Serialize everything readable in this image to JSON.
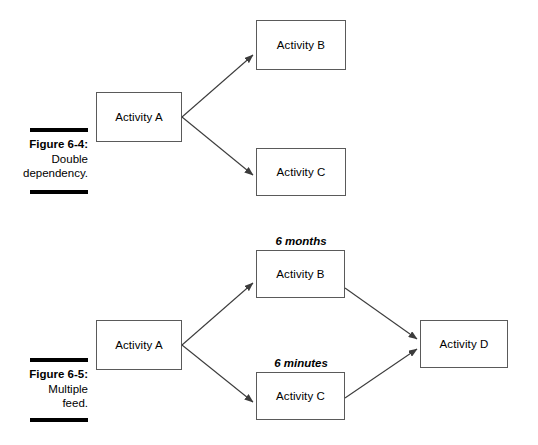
{
  "figures": [
    {
      "caption_number": "Figure 6-4:",
      "caption_description_line1": "Double",
      "caption_description_line2": "dependency.",
      "nodes": [
        {
          "id": "a",
          "label": "Activity A"
        },
        {
          "id": "b",
          "label": "Activity B"
        },
        {
          "id": "c",
          "label": "Activity C"
        }
      ],
      "edges": [
        {
          "from": "Activity A",
          "to": "Activity B"
        },
        {
          "from": "Activity A",
          "to": "Activity C"
        }
      ]
    },
    {
      "caption_number": "Figure 6-5:",
      "caption_description_line1": "Multiple",
      "caption_description_line2": "feed.",
      "nodes": [
        {
          "id": "a",
          "label": "Activity A"
        },
        {
          "id": "b",
          "label": "Activity B"
        },
        {
          "id": "c",
          "label": "Activity C"
        },
        {
          "id": "d",
          "label": "Activity D"
        }
      ],
      "durations": {
        "upper": "6 months",
        "lower": "6 minutes"
      },
      "edges": [
        {
          "from": "Activity A",
          "to": "Activity B"
        },
        {
          "from": "Activity A",
          "to": "Activity C"
        },
        {
          "from": "Activity B",
          "to": "Activity D"
        },
        {
          "from": "Activity C",
          "to": "Activity D"
        }
      ]
    }
  ],
  "colors": {
    "box_border": "#5a5a5a",
    "connector": "#3c3c3c",
    "rule": "#000000",
    "text": "#000000",
    "background": "#ffffff"
  }
}
